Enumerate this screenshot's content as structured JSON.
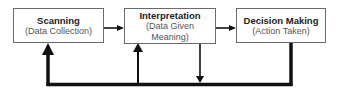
{
  "diagram": {
    "type": "flowchart-feedback-loop",
    "nodes": [
      {
        "id": "scanning",
        "title": "Scanning",
        "subtitle": "(Data Collection)"
      },
      {
        "id": "interpretation",
        "title": "Interpretation",
        "subtitle_line1": "(Data Given",
        "subtitle_line2": "Meaning)"
      },
      {
        "id": "decision",
        "title": "Decision Making",
        "subtitle": "(Action Taken)"
      }
    ],
    "edges": [
      {
        "from": "scanning",
        "to": "interpretation",
        "kind": "forward-arrow"
      },
      {
        "from": "interpretation",
        "to": "decision",
        "kind": "forward-arrow"
      },
      {
        "from": "decision",
        "to": "feedback-line",
        "kind": "thick-line-down"
      },
      {
        "from": "interpretation",
        "to": "feedback-line",
        "kind": "arrow-down"
      },
      {
        "from": "feedback-line",
        "to": "interpretation",
        "kind": "arrow-up"
      },
      {
        "from": "feedback-line",
        "to": "scanning",
        "kind": "thick-arrow-up"
      }
    ],
    "colors": {
      "line": "#111111",
      "box_border": "#6a6a6a",
      "title_text": "#222222",
      "subtitle_text": "#555555"
    }
  }
}
